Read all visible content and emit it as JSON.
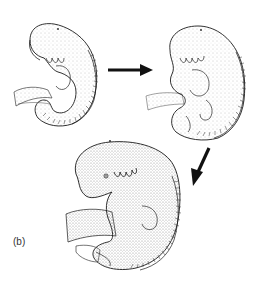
{
  "figure": {
    "panel_label": "(b)",
    "stages": [
      {
        "name": "embryo-stage-1",
        "position": "top-left"
      },
      {
        "name": "embryo-stage-2",
        "position": "top-right"
      },
      {
        "name": "embryo-stage-3",
        "position": "bottom-center"
      }
    ],
    "arrows": [
      {
        "from": "embryo-stage-1",
        "to": "embryo-stage-2",
        "direction": "right"
      },
      {
        "from": "embryo-stage-2",
        "to": "embryo-stage-3",
        "direction": "down-left"
      }
    ],
    "colors": {
      "ink": "#1a1a1a",
      "stipple": "#9a9a9a",
      "background": "#ffffff"
    }
  }
}
